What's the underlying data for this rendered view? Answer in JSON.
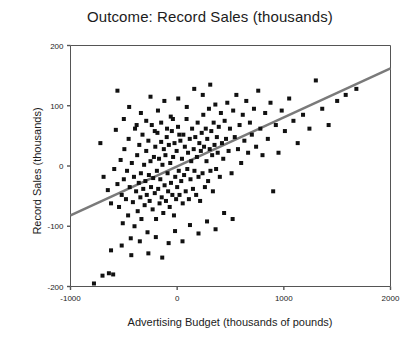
{
  "chart_data": {
    "type": "scatter",
    "title": "Outcome: Record Sales (thousands)",
    "xlabel": "Advertising Budget (thousands of pounds)",
    "ylabel": "Record Sales (thousands)",
    "xlim": [
      -1000,
      2000
    ],
    "ylim": [
      -200,
      200
    ],
    "xticks": [
      -1000,
      0,
      1000,
      2000
    ],
    "xtick_labels": [
      "-1000",
      "0",
      "1000",
      "2000"
    ],
    "yticks": [
      -200,
      -100,
      0,
      100,
      200
    ],
    "ytick_labels": [
      "-200",
      "-100",
      "0",
      "100",
      "200"
    ],
    "grid": false,
    "legend": null,
    "marker": "square",
    "marker_color": "#111111",
    "marker_size": 4,
    "frame_color": "#555555",
    "background": "#ffffff",
    "trendline": {
      "type": "linear",
      "color": "#7a7a7a",
      "width": 2.5,
      "x_start": -1000,
      "y_start": -82,
      "x_end": 2000,
      "y_end": 162,
      "slope": 0.0813,
      "intercept": -1.3
    },
    "points": [
      [
        -780,
        -195
      ],
      [
        -700,
        -182
      ],
      [
        -640,
        -178
      ],
      [
        -600,
        -180
      ],
      [
        -720,
        38
      ],
      [
        -690,
        -18
      ],
      [
        -650,
        -40
      ],
      [
        -620,
        -62
      ],
      [
        -590,
        -5
      ],
      [
        -575,
        60
      ],
      [
        -560,
        -30
      ],
      [
        -545,
        -68
      ],
      [
        -530,
        10
      ],
      [
        -520,
        -48
      ],
      [
        -510,
        -95
      ],
      [
        -500,
        -22
      ],
      [
        -495,
        28
      ],
      [
        -480,
        -55
      ],
      [
        -470,
        -8
      ],
      [
        -460,
        -82
      ],
      [
        -455,
        45
      ],
      [
        -445,
        -35
      ],
      [
        -435,
        -120
      ],
      [
        -425,
        5
      ],
      [
        -415,
        -60
      ],
      [
        -405,
        -18
      ],
      [
        -400,
        -100
      ],
      [
        -395,
        62
      ],
      [
        -385,
        -42
      ],
      [
        -375,
        18
      ],
      [
        -370,
        -75
      ],
      [
        -360,
        -28
      ],
      [
        -355,
        35
      ],
      [
        -345,
        -52
      ],
      [
        -340,
        -12
      ],
      [
        -335,
        -88
      ],
      [
        -325,
        52
      ],
      [
        -318,
        -38
      ],
      [
        -310,
        2
      ],
      [
        -305,
        -65
      ],
      [
        -298,
        -25
      ],
      [
        -290,
        25
      ],
      [
        -285,
        -48
      ],
      [
        -278,
        -110
      ],
      [
        -270,
        42
      ],
      [
        -265,
        -15
      ],
      [
        -258,
        -58
      ],
      [
        -250,
        8
      ],
      [
        -245,
        -35
      ],
      [
        -238,
        68
      ],
      [
        -230,
        -72
      ],
      [
        -225,
        -20
      ],
      [
        -218,
        15
      ],
      [
        -210,
        -45
      ],
      [
        -205,
        32
      ],
      [
        -198,
        -88
      ],
      [
        -190,
        -8
      ],
      [
        -185,
        55
      ],
      [
        -178,
        -38
      ],
      [
        -170,
        12
      ],
      [
        -165,
        -62
      ],
      [
        -158,
        -22
      ],
      [
        -150,
        40
      ],
      [
        -145,
        -52
      ],
      [
        -138,
        2
      ],
      [
        -130,
        -78
      ],
      [
        -125,
        28
      ],
      [
        -118,
        -32
      ],
      [
        -110,
        18
      ],
      [
        -105,
        -58
      ],
      [
        -98,
        48
      ],
      [
        -90,
        -12
      ],
      [
        -85,
        -42
      ],
      [
        -78,
        35
      ],
      [
        -70,
        -68
      ],
      [
        -65,
        5
      ],
      [
        -58,
        -28
      ],
      [
        -50,
        58
      ],
      [
        -45,
        -48
      ],
      [
        -38,
        15
      ],
      [
        -30,
        -82
      ],
      [
        -25,
        38
      ],
      [
        -18,
        -18
      ],
      [
        -10,
        -55
      ],
      [
        -5,
        25
      ],
      [
        0,
        -35
      ],
      [
        8,
        65
      ],
      [
        15,
        -8
      ],
      [
        22,
        -48
      ],
      [
        30,
        42
      ],
      [
        38,
        -25
      ],
      [
        45,
        12
      ],
      [
        52,
        -62
      ],
      [
        58,
        52
      ],
      [
        65,
        -15
      ],
      [
        72,
        32
      ],
      [
        80,
        -42
      ],
      [
        88,
        78
      ],
      [
        95,
        -5
      ],
      [
        102,
        22
      ],
      [
        110,
        -55
      ],
      [
        118,
        45
      ],
      [
        125,
        -22
      ],
      [
        132,
        8
      ],
      [
        140,
        62
      ],
      [
        148,
        -38
      ],
      [
        155,
        28
      ],
      [
        162,
        -8
      ],
      [
        170,
        48
      ],
      [
        178,
        -48
      ],
      [
        185,
        15
      ],
      [
        192,
        72
      ],
      [
        200,
        -18
      ],
      [
        208,
        38
      ],
      [
        215,
        -58
      ],
      [
        222,
        25
      ],
      [
        230,
        55
      ],
      [
        238,
        -12
      ],
      [
        245,
        85
      ],
      [
        252,
        32
      ],
      [
        260,
        -35
      ],
      [
        268,
        62
      ],
      [
        275,
        8
      ],
      [
        282,
        45
      ],
      [
        290,
        -25
      ],
      [
        298,
        95
      ],
      [
        305,
        28
      ],
      [
        312,
        -8
      ],
      [
        320,
        58
      ],
      [
        328,
        18
      ],
      [
        335,
        -42
      ],
      [
        342,
        72
      ],
      [
        350,
        35
      ],
      [
        358,
        102
      ],
      [
        365,
        -5
      ],
      [
        372,
        48
      ],
      [
        380,
        22
      ],
      [
        390,
        65
      ],
      [
        400,
        -18
      ],
      [
        410,
        88
      ],
      [
        420,
        38
      ],
      [
        432,
        12
      ],
      [
        445,
        75
      ],
      [
        458,
        45
      ],
      [
        470,
        105
      ],
      [
        482,
        25
      ],
      [
        495,
        62
      ],
      [
        510,
        -12
      ],
      [
        525,
        92
      ],
      [
        540,
        48
      ],
      [
        555,
        118
      ],
      [
        570,
        28
      ],
      [
        585,
        68
      ],
      [
        600,
        5
      ],
      [
        615,
        85
      ],
      [
        630,
        42
      ],
      [
        648,
        108
      ],
      [
        665,
        22
      ],
      [
        682,
        72
      ],
      [
        700,
        52
      ],
      [
        720,
        95
      ],
      [
        740,
        32
      ],
      [
        760,
        125
      ],
      [
        780,
        62
      ],
      [
        800,
        18
      ],
      [
        825,
        88
      ],
      [
        850,
        45
      ],
      [
        875,
        105
      ],
      [
        900,
        -42
      ],
      [
        925,
        68
      ],
      [
        950,
        22
      ],
      [
        980,
        92
      ],
      [
        1010,
        58
      ],
      [
        1050,
        112
      ],
      [
        1090,
        75
      ],
      [
        1130,
        38
      ],
      [
        1180,
        85
      ],
      [
        1240,
        62
      ],
      [
        1300,
        142
      ],
      [
        1360,
        95
      ],
      [
        1420,
        68
      ],
      [
        1500,
        108
      ],
      [
        1580,
        118
      ],
      [
        1680,
        128
      ],
      [
        -560,
        125
      ],
      [
        -450,
        98
      ],
      [
        -340,
        88
      ],
      [
        -250,
        115
      ],
      [
        -180,
        92
      ],
      [
        -120,
        108
      ],
      [
        -60,
        82
      ],
      [
        10,
        112
      ],
      [
        90,
        98
      ],
      [
        160,
        128
      ],
      [
        240,
        118
      ],
      [
        310,
        135
      ],
      [
        -620,
        -140
      ],
      [
        -520,
        -132
      ],
      [
        -430,
        -148
      ],
      [
        -350,
        -125
      ],
      [
        -270,
        -145
      ],
      [
        -200,
        -118
      ],
      [
        -140,
        -152
      ],
      [
        -80,
        -128
      ],
      [
        -20,
        -108
      ],
      [
        50,
        -125
      ],
      [
        120,
        -98
      ],
      [
        200,
        -112
      ],
      [
        280,
        -92
      ],
      [
        360,
        -105
      ],
      [
        440,
        -78
      ],
      [
        520,
        -88
      ],
      [
        -500,
        78
      ],
      [
        -380,
        68
      ],
      [
        -290,
        75
      ],
      [
        -210,
        58
      ],
      [
        -150,
        72
      ],
      [
        -95,
        62
      ],
      [
        -40,
        78
      ],
      [
        20,
        52
      ]
    ]
  }
}
